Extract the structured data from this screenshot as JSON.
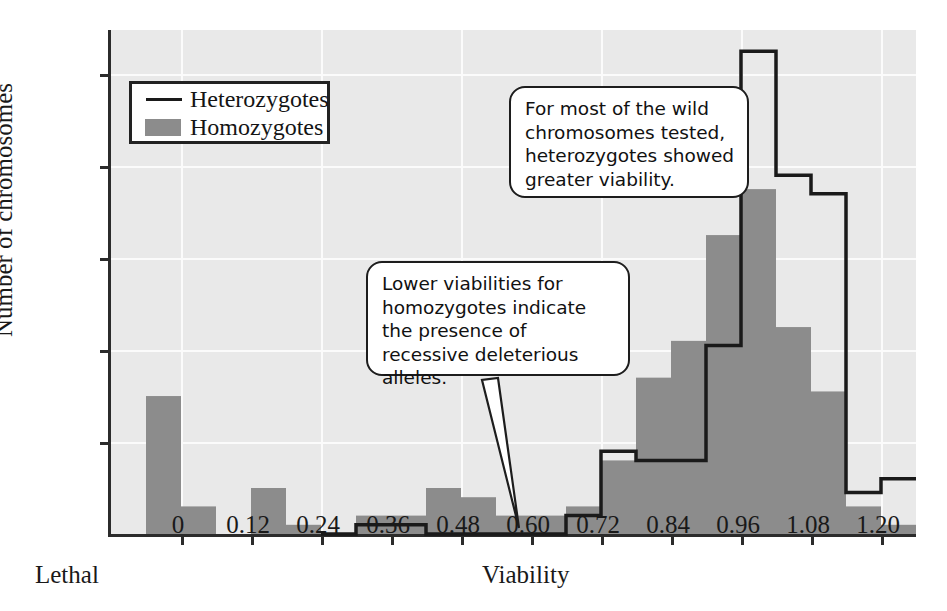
{
  "chart_data": {
    "type": "bar",
    "title": "",
    "subtitle": "",
    "xlabel": "Viability",
    "ylabel": "Number of chromosomes",
    "xlabel_secondary": "Lethal",
    "x_tick_labels": [
      "0",
      "0.12",
      "0.24",
      "0.36",
      "0.48",
      "0.60",
      "0.72",
      "0.84",
      "0.96",
      "1.08",
      "1.20"
    ],
    "x_tick_values": [
      0,
      0.12,
      0.24,
      0.36,
      0.48,
      0.6,
      0.72,
      0.84,
      0.96,
      1.08,
      1.2
    ],
    "y_tick_labels": [
      "10",
      "20",
      "30",
      "40",
      "50"
    ],
    "y_tick_values": [
      10,
      20,
      30,
      40,
      50
    ],
    "ylim": [
      0,
      54.8
    ],
    "xlim": [
      -0.12,
      1.26
    ],
    "bin_width": 0.06,
    "grid": true,
    "grid_color": "#fbfbfb",
    "plot_background": "#e9e9e9",
    "legend_position": "upper-left",
    "series": [
      {
        "name": "Homozygotes",
        "style": "filled-bars",
        "color": "#8c8c8c",
        "bin_starts": [
          -0.12,
          -0.06,
          0.0,
          0.06,
          0.12,
          0.18,
          0.24,
          0.3,
          0.36,
          0.42,
          0.48,
          0.54,
          0.6,
          0.66,
          0.72,
          0.78,
          0.84,
          0.9,
          0.96,
          1.02,
          1.08,
          1.14,
          1.2
        ],
        "values": [
          0,
          15,
          3,
          0,
          5,
          1,
          0,
          2,
          2,
          5,
          4,
          2,
          2,
          3,
          8,
          17,
          21,
          32.5,
          37.5,
          22.5,
          15.5,
          3,
          1
        ]
      },
      {
        "name": "Heterozygotes",
        "style": "outline-steps",
        "color": "#1a1a1a",
        "bin_starts": [
          -0.12,
          -0.06,
          0.0,
          0.06,
          0.12,
          0.18,
          0.24,
          0.3,
          0.36,
          0.42,
          0.48,
          0.54,
          0.6,
          0.66,
          0.72,
          0.78,
          0.84,
          0.9,
          0.96,
          1.02,
          1.08,
          1.14,
          1.2
        ],
        "values": [
          0,
          0,
          0,
          0,
          0,
          0,
          0,
          1,
          1,
          0,
          0,
          0,
          0,
          2,
          9,
          8,
          8,
          20.5,
          52.5,
          39,
          37,
          4.5,
          6
        ]
      }
    ]
  },
  "legend": {
    "items": [
      {
        "label": "Heterozygotes",
        "swatch": "line",
        "color": "#1a1a1a"
      },
      {
        "label": "Homozygotes",
        "swatch": "box",
        "color": "#8c8c8c"
      }
    ]
  },
  "callouts": [
    {
      "id": "callout-hetero",
      "text": "For most of the wild chromosomes tested, heterozygotes showed greater viability."
    },
    {
      "id": "callout-homo",
      "text": "Lower viabilities for homozygotes indicate the presence of recessive deleterious alleles."
    }
  ],
  "colors": {
    "homozygote_fill": "#8c8c8c",
    "heterozygote_outline": "#1a1a1a",
    "axis": "#2b2b2b",
    "plot_background": "#e9e9e9",
    "gridline": "#fbfbfb",
    "text": "#191919"
  }
}
